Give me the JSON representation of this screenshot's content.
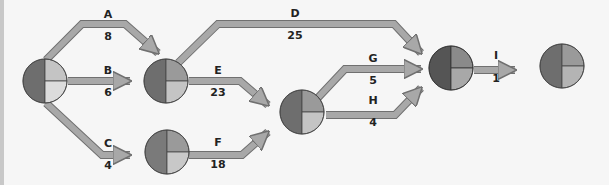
{
  "diagram": {
    "type": "activity-on-arrow network",
    "colors": {
      "background": "#f6f6f6",
      "arrow_fill": "#a8a8a8",
      "arrow_stroke": "#707070",
      "quad_dark": "#6e6e6e",
      "quad_mid": "#9a9a9a",
      "quad_light": "#c4c4c4",
      "quad_lighter": "#dcdcdc",
      "node_dark_final": "#555555"
    },
    "nodes": [
      {
        "id": "n1",
        "label": "start node"
      },
      {
        "id": "n2",
        "label": "node after A/B"
      },
      {
        "id": "n3",
        "label": "node after C"
      },
      {
        "id": "n4",
        "label": "node after E/F"
      },
      {
        "id": "n5",
        "label": "node after D/G/H"
      },
      {
        "id": "n6",
        "label": "end node"
      }
    ],
    "activities": [
      {
        "name": "A",
        "duration": "8"
      },
      {
        "name": "B",
        "duration": "6"
      },
      {
        "name": "C",
        "duration": "4"
      },
      {
        "name": "D",
        "duration": "25"
      },
      {
        "name": "E",
        "duration": "23"
      },
      {
        "name": "F",
        "duration": "18"
      },
      {
        "name": "G",
        "duration": "5"
      },
      {
        "name": "H",
        "duration": "4"
      },
      {
        "name": "I",
        "duration": "1"
      }
    ]
  }
}
